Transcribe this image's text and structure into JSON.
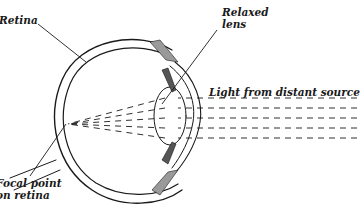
{
  "figure": {
    "labels": {
      "retina": "Retina",
      "relaxed_lens_line1": "Relaxed",
      "relaxed_lens_line2": "lens",
      "light_source": "Light from distant source",
      "focal_point_line1": "Focal point",
      "focal_point_line2": "on retina"
    },
    "colors": {
      "ink": "#1a1a1a",
      "muscle_dark": "#555555",
      "muscle_light": "#9a9a9a",
      "background": "#ffffff"
    },
    "light_rays": {
      "count": 5,
      "style": "dashed",
      "converge_to": "focal point on retina"
    }
  }
}
